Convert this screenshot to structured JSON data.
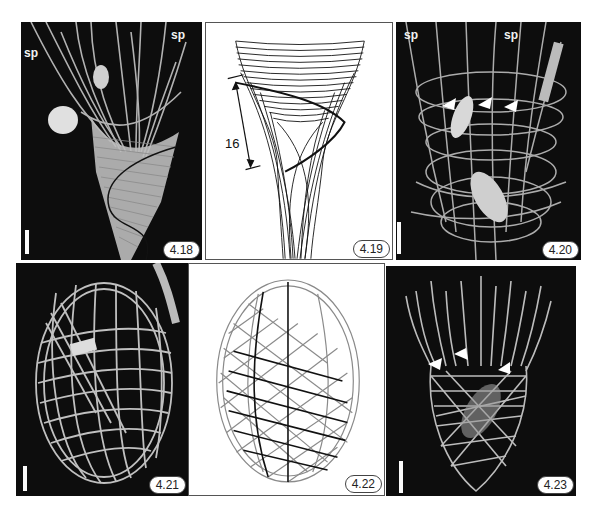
{
  "figure": {
    "panels": [
      {
        "id": "4.18",
        "type": "sem-micrograph",
        "annotations": [
          "sp",
          "sp"
        ],
        "has_scale_bar": true,
        "overlay": "dark helical line tracing one costa"
      },
      {
        "id": "4.19",
        "type": "line-drawing",
        "dimension_label": "16",
        "description": "conical lorica with crossing helical costae"
      },
      {
        "id": "4.20",
        "type": "sem-micrograph",
        "annotations": [
          "sp",
          "sp"
        ],
        "arrowheads": 3,
        "has_scale_bar": true
      },
      {
        "id": "4.21",
        "type": "sem-micrograph",
        "has_scale_bar": true,
        "description": "ovoid lorica"
      },
      {
        "id": "4.22",
        "type": "line-drawing",
        "description": "ovoid lorica model with gray and black helical costae"
      },
      {
        "id": "4.23",
        "type": "sem-micrograph",
        "arrowheads": 3,
        "has_scale_bar": true,
        "description": "lorica with anterior spines"
      }
    ],
    "labels": {
      "p18": "4.18",
      "p19": "4.19",
      "p20": "4.20",
      "p21": "4.21",
      "p22": "4.22",
      "p23": "4.23"
    },
    "annotations": {
      "sp": "sp",
      "dimension": "16"
    },
    "colors": {
      "sem_background": "#0d0d0d",
      "costa_light": "#d8d8d8",
      "drawing_dark": "#111111",
      "drawing_gray": "#8a8a8a",
      "label_border": "#444444"
    }
  }
}
